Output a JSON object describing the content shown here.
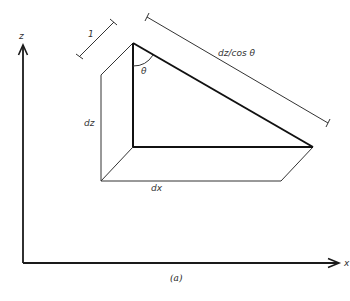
{
  "figure": {
    "caption": "(a)",
    "colors": {
      "stroke": "#1a1a1a",
      "background": "#ffffff"
    }
  },
  "axes": {
    "z_label": "z",
    "x_label": "x"
  },
  "labels": {
    "unit_length": "1",
    "angle": "θ",
    "height": "dz",
    "width": "dx",
    "hypotenuse": "dz/cos θ"
  }
}
